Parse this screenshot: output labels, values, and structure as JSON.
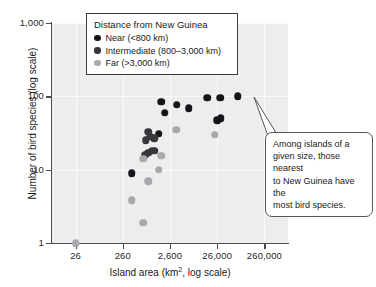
{
  "chart_data": {
    "type": "scatter",
    "title": "",
    "xlabel": "Island area (km2, log scale)",
    "xlabel_main": "Island area (km",
    "xlabel_sup": "2",
    "xlabel_tail": ", log scale)",
    "ylabel": "Number of bird species (log scale)",
    "xscale": "log",
    "yscale": "log",
    "xlim": [
      8.22,
      822000
    ],
    "ylim": [
      1,
      1000
    ],
    "xticks": [
      26,
      260,
      2600,
      26000,
      260000
    ],
    "xticklabels": [
      "26",
      "260",
      "2,600",
      "26,000",
      "260,000"
    ],
    "yticks": [
      1,
      10,
      100,
      1000
    ],
    "yticklabels": [
      "1",
      "10",
      "100",
      "1,000"
    ],
    "grid": true,
    "legend_position": "top-center",
    "legend": {
      "title": "Distance from New Guinea",
      "entries": [
        {
          "key": "near",
          "label": "Near (<800 km)",
          "color": "#15161a"
        },
        {
          "key": "intermediate",
          "label": "Intermediate (800–3,000 km)",
          "color": "#35373c"
        },
        {
          "key": "far",
          "label": "Far (>3,000 km)",
          "color": "#a7a9ad"
        }
      ]
    },
    "annotations": [
      {
        "text": "Among islands of a given size, those nearest to New Guinea have the most bird species.",
        "lines": [
          "Among islands of a",
          "given size, those nearest",
          "to New Guinea have the",
          "most bird species."
        ],
        "points_to": {
          "x": 70000,
          "y": 100
        }
      }
    ],
    "series": [
      {
        "name": "Near (<800 km)",
        "color": "#15161a",
        "points": [
          {
            "x": 400,
            "y": 9
          },
          {
            "x": 1700,
            "y": 85
          },
          {
            "x": 2000,
            "y": 60
          },
          {
            "x": 1500,
            "y": 31
          },
          {
            "x": 3600,
            "y": 77
          },
          {
            "x": 6500,
            "y": 69
          },
          {
            "x": 16000,
            "y": 96
          },
          {
            "x": 30000,
            "y": 95
          },
          {
            "x": 70000,
            "y": 100
          },
          {
            "x": 26000,
            "y": 47
          },
          {
            "x": 31000,
            "y": 50
          }
        ]
      },
      {
        "name": "Intermediate (800–3,000 km)",
        "color": "#35373c",
        "points": [
          {
            "x": 900,
            "y": 33
          },
          {
            "x": 800,
            "y": 25
          },
          {
            "x": 1200,
            "y": 27
          },
          {
            "x": 1000,
            "y": 28
          },
          {
            "x": 900,
            "y": 17
          },
          {
            "x": 1100,
            "y": 18
          },
          {
            "x": 1250,
            "y": 18
          },
          {
            "x": 780,
            "y": 16
          }
        ]
      },
      {
        "name": "Far (>3,000 km)",
        "color": "#a7a9ad",
        "points": [
          {
            "x": 26,
            "y": 1
          },
          {
            "x": 400,
            "y": 3.8
          },
          {
            "x": 700,
            "y": 1.9
          },
          {
            "x": 700,
            "y": 14
          },
          {
            "x": 900,
            "y": 7
          },
          {
            "x": 1500,
            "y": 10
          },
          {
            "x": 1700,
            "y": 15.5
          },
          {
            "x": 3500,
            "y": 35
          },
          {
            "x": 23000,
            "y": 30
          }
        ]
      }
    ]
  }
}
